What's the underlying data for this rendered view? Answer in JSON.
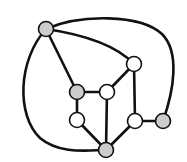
{
  "diagram": {
    "type": "planar-graph",
    "node_radius": 7.5,
    "colors": {
      "background": "#ffffff",
      "edge": "#111111",
      "node_stroke": "#111111",
      "gray_fill": "#cccccc",
      "white_fill": "#ffffff"
    },
    "nodes": [
      {
        "id": "a",
        "x": 46,
        "y": 29,
        "fill": "gray"
      },
      {
        "id": "b",
        "x": 134,
        "y": 64,
        "fill": "white"
      },
      {
        "id": "c",
        "x": 77,
        "y": 92,
        "fill": "gray"
      },
      {
        "id": "d",
        "x": 107,
        "y": 92,
        "fill": "white"
      },
      {
        "id": "e",
        "x": 77,
        "y": 120,
        "fill": "white"
      },
      {
        "id": "f",
        "x": 135,
        "y": 121,
        "fill": "white"
      },
      {
        "id": "g",
        "x": 163,
        "y": 121,
        "fill": "gray"
      },
      {
        "id": "h",
        "x": 106,
        "y": 150,
        "fill": "gray"
      }
    ],
    "edges": [
      {
        "from": "a",
        "to": "g",
        "path": "M46,29 C80,14 140,14 162,34 C180,52 174,90 163,121"
      },
      {
        "from": "a",
        "to": "b",
        "path": "M46,29 C80,34 115,44 134,64"
      },
      {
        "from": "a",
        "to": "h",
        "path": "M46,29 C18,60 16,115 40,138 C60,155 90,150 106,150"
      },
      {
        "from": "a",
        "to": "c",
        "path": "M46,29 L77,92"
      },
      {
        "from": "b",
        "to": "d",
        "path": "M134,64 L107,92"
      },
      {
        "from": "b",
        "to": "f",
        "path": "M134,64 L135,121"
      },
      {
        "from": "c",
        "to": "d",
        "path": "M77,92 L107,92"
      },
      {
        "from": "c",
        "to": "e",
        "path": "M77,92 L77,120"
      },
      {
        "from": "d",
        "to": "h",
        "path": "M107,92 L106,150"
      },
      {
        "from": "e",
        "to": "h",
        "path": "M77,120 L106,150"
      },
      {
        "from": "f",
        "to": "h",
        "path": "M135,121 L106,150"
      },
      {
        "from": "f",
        "to": "g",
        "path": "M135,121 L163,121"
      }
    ]
  }
}
